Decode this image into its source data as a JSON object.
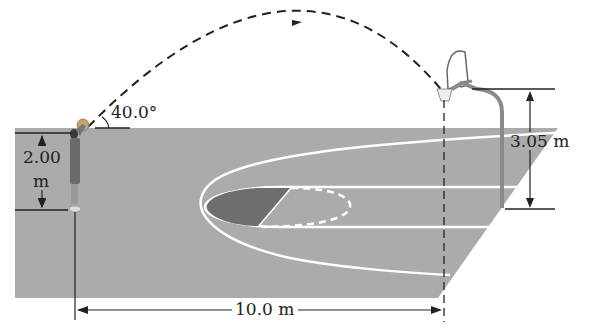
{
  "figure": {
    "angle_label": "40.0°",
    "release_height": {
      "value": "2.00",
      "unit": "m"
    },
    "rim_height_label": "3.05 m",
    "horizontal_distance_label": "10.0 m",
    "elements": {
      "player": "basketball-player-shooting",
      "ball": "basketball",
      "trajectory": "dashed-parabolic-path-with-arrow",
      "hoop": "basketball-hoop-backboard-pole",
      "court": "gray-court-floor-with-white-key-lines"
    }
  },
  "colors": {
    "court": "#ababab",
    "court_lines": "#ffffff",
    "key_shaded": "#6e6e6e",
    "lines": "#222222",
    "player": "#555555",
    "pole": "#8a8a8a"
  }
}
